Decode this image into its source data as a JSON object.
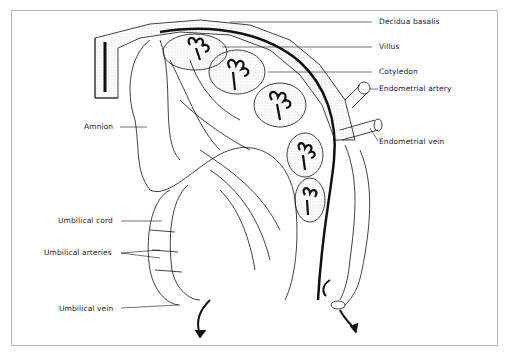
{
  "diagram": {
    "labels": {
      "decidua_basalis": "Decidua basalis",
      "villus": "Villus",
      "cotyledon": "Cotyledon",
      "endometrial_artery": "Endometrial artery",
      "endometrial_vein": "Endometrial vein",
      "amnion": "Amnion",
      "umbilical_cord": "Umbilical cord",
      "umbilical_arteries": "Umbilical arteries",
      "umbilical_vein": "Umbilical vein"
    },
    "colors": {
      "line": "#111111",
      "frame": "#b8b8b8",
      "stipple": "#c8c8c8"
    }
  }
}
